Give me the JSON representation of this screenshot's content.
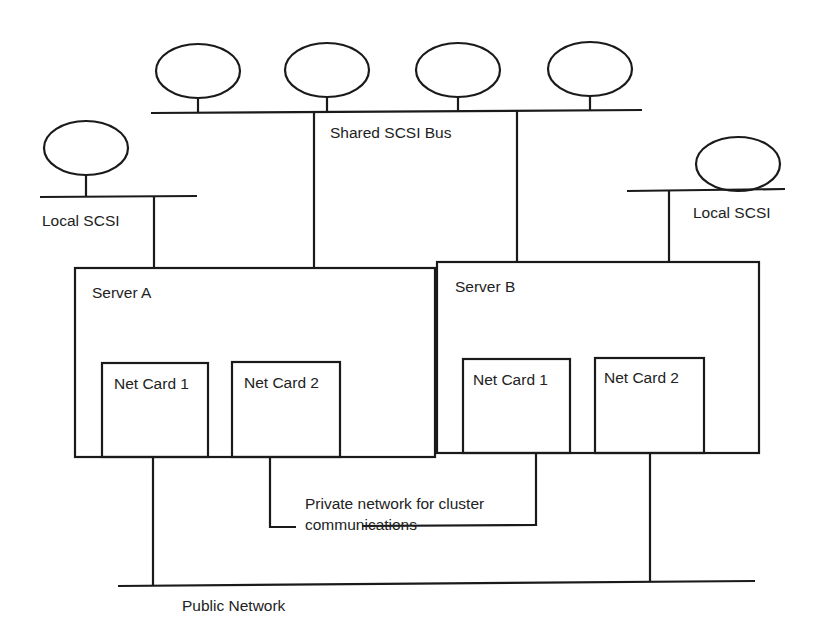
{
  "diagram": {
    "type": "cluster-network-topology",
    "colors": {
      "line": "#1a1a1a",
      "text": "#222222",
      "background": "#ffffff"
    },
    "shared_bus": {
      "label": "Shared SCSI Bus",
      "disk_count": 4
    },
    "local_bus_a": {
      "label": "Local SCSI"
    },
    "local_bus_b": {
      "label": "Local SCSI"
    },
    "server_a": {
      "label": "Server A",
      "net_card_1": "Net Card 1",
      "net_card_2": "Net Card 2"
    },
    "server_b": {
      "label": "Server B",
      "net_card_1": "Net Card 1",
      "net_card_2": "Net Card 2"
    },
    "private_network": {
      "line1": "Private network for cluster",
      "line2": "communications"
    },
    "public_network": {
      "label": "Public Network"
    }
  }
}
